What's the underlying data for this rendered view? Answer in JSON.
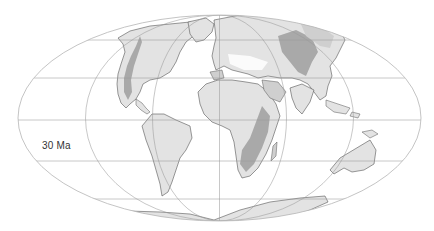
{
  "map": {
    "projection": "Mollweide",
    "age_label": "30 Ma",
    "colors": {
      "background": "#ffffff",
      "ocean": "#ffffff",
      "land_low": "#e3e3e3",
      "land_mid": "#cfcfcf",
      "land_high": "#a9a9a9",
      "coastline": "#555555",
      "graticule": "#9a9a9a",
      "outline": "#b5b5b5"
    },
    "graticule": {
      "parallels_deg": [
        -60,
        -30,
        0,
        30,
        60
      ],
      "meridians_deg": [
        -180,
        -120,
        -60,
        0,
        60,
        120,
        180
      ]
    },
    "landmasses": [
      {
        "name": "North America"
      },
      {
        "name": "Greenland"
      },
      {
        "name": "Eurasia"
      },
      {
        "name": "Africa"
      },
      {
        "name": "Arabia"
      },
      {
        "name": "India"
      },
      {
        "name": "South America"
      },
      {
        "name": "Madagascar"
      },
      {
        "name": "Australia"
      },
      {
        "name": "Antarctica"
      },
      {
        "name": "Southeast Asia islands"
      }
    ]
  }
}
